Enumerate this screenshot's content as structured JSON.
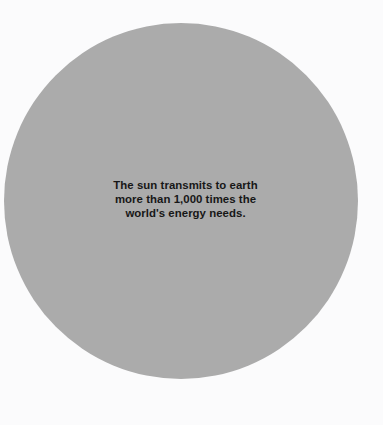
{
  "graphic": {
    "type": "statistic-callout",
    "background_color": "#fbfbfc",
    "shape": {
      "name": "sun-disc",
      "form": "circle",
      "fill_color": "#ababab"
    },
    "caption": {
      "text_color": "#171717",
      "alignment": "center",
      "weight": "bold",
      "full_text": "The sun transmits to earth more than 1,000 times the world's energy needs.",
      "lines": [
        "The sun transmits to earth",
        "more than 1,000 times the",
        "world's energy needs."
      ]
    }
  }
}
